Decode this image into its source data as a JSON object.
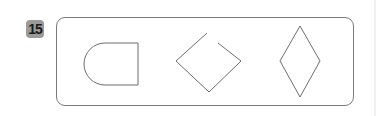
{
  "problem": {
    "number": "15",
    "badge_color": "#9a9a9a",
    "shapes": [
      {
        "name": "d-shape",
        "description": "rounded-left half rectangle"
      },
      {
        "name": "open-square-rotated",
        "description": "rotated square with gap at top"
      },
      {
        "name": "rhombus",
        "description": "vertical diamond"
      }
    ],
    "stroke_color": "#6e6e6e"
  }
}
